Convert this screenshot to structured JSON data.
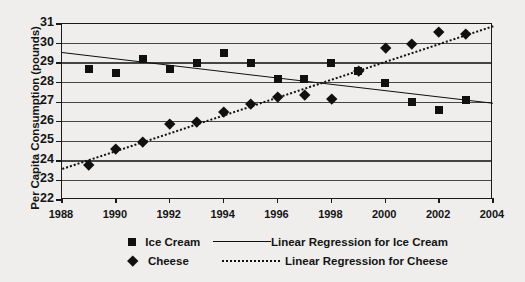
{
  "chart_data": {
    "type": "scatter",
    "title": "",
    "xlabel": "",
    "ylabel": "Per Capita Consumption (pounds)",
    "xlim": [
      1988,
      2004
    ],
    "ylim": [
      22,
      31
    ],
    "xticks": [
      1988,
      1990,
      1992,
      1994,
      1996,
      1998,
      2000,
      2002,
      2004
    ],
    "yticks": [
      22,
      23,
      24,
      25,
      26,
      27,
      28,
      29,
      30,
      31
    ],
    "grid": "horizontal",
    "legend_position": "bottom",
    "x": [
      1989,
      1990,
      1991,
      1992,
      1993,
      1994,
      1995,
      1996,
      1997,
      1998,
      1999,
      2000,
      2001,
      2002,
      2003
    ],
    "series": [
      {
        "name": "Ice Cream",
        "marker": "square",
        "values": [
          28.7,
          28.5,
          29.2,
          28.7,
          29.0,
          29.5,
          29.0,
          28.2,
          28.2,
          29.0,
          28.6,
          28.0,
          27.0,
          26.6,
          27.1
        ]
      },
      {
        "name": "Cheese",
        "marker": "diamond",
        "values": [
          23.8,
          24.6,
          25.0,
          25.9,
          26.0,
          26.5,
          26.9,
          27.3,
          27.4,
          27.2,
          28.6,
          29.8,
          30.0,
          30.6,
          30.5
        ]
      }
    ],
    "trendlines": [
      {
        "name": "Linear Regression for Ice Cream",
        "style": "solid",
        "x_start": 1988,
        "y_start": 29.55,
        "x_end": 2004,
        "y_end": 26.95
      },
      {
        "name": "Linear Regression for Cheese",
        "style": "dotted",
        "x_start": 1988,
        "y_start": 23.65,
        "x_end": 2004,
        "y_end": 30.95
      }
    ],
    "legend": [
      {
        "label": "Ice Cream",
        "marker": "square",
        "line_label": "Linear Regression for Ice Cream",
        "line_style": "solid"
      },
      {
        "label": "Cheese",
        "marker": "diamond",
        "line_label": "Linear Regression for Cheese",
        "line_style": "dotted"
      }
    ],
    "colors": {
      "marker": "#101010",
      "line": "#101010",
      "grid": "#454545",
      "axis": "#1a1a1a",
      "background": "#efeeec"
    }
  }
}
